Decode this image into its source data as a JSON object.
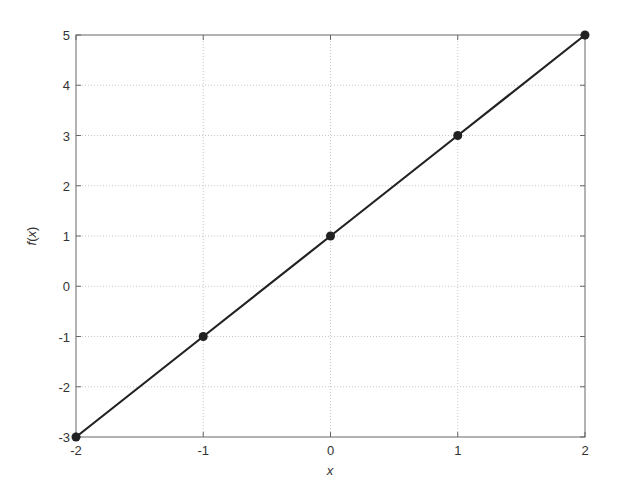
{
  "chart_data": {
    "type": "line",
    "title": "",
    "xlabel": "x",
    "ylabel": "f(x)",
    "ylabel_parts": {
      "func": "f",
      "open": "(",
      "var": "x",
      "close": ")"
    },
    "x": [
      -2,
      -1,
      0,
      1,
      2
    ],
    "series": [
      {
        "name": "f(x)",
        "values": [
          -3,
          -1,
          1,
          3,
          5
        ],
        "markers": true,
        "color": "#222222"
      }
    ],
    "xlim": [
      -2,
      2
    ],
    "ylim": [
      -3,
      5
    ],
    "xticks": [
      -2,
      -1,
      0,
      1,
      2
    ],
    "yticks": [
      -3,
      -2,
      -1,
      0,
      1,
      2,
      3,
      4,
      5
    ],
    "xtick_labels": [
      "-2",
      "-1",
      "0",
      "1",
      "2"
    ],
    "ytick_labels": [
      "-3",
      "-2",
      "-1",
      "0",
      "1",
      "2",
      "3",
      "4",
      "5"
    ],
    "grid": true,
    "legend": null
  },
  "colors": {
    "line": "#222222",
    "axis": "#666666",
    "grid": "#c8c8c8",
    "text": "#333333"
  }
}
